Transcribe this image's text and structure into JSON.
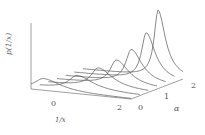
{
  "chart_data": {
    "type": "area",
    "subtype": "3d-waterfall",
    "title": "",
    "xlabel": "1/x",
    "ylabel": "p(1/x)",
    "zlabel": "α",
    "x_ticks": [
      "0",
      "2"
    ],
    "z_ticks": [
      "0",
      "1",
      "2"
    ],
    "grid": false,
    "legend": null,
    "series": [
      {
        "name": "α=0.0",
        "peak_x": -0.6,
        "peak_height": 0.15
      },
      {
        "name": "α=0.33",
        "peak_x": 0.2,
        "peak_height": 0.18
      },
      {
        "name": "α=0.67",
        "peak_x": 0.6,
        "peak_height": 0.25
      },
      {
        "name": "α=1.0",
        "peak_x": 0.9,
        "peak_height": 0.32
      },
      {
        "name": "α=1.33",
        "peak_x": 1.1,
        "peak_height": 0.42
      },
      {
        "name": "α=1.67",
        "peak_x": 1.3,
        "peak_height": 0.6
      },
      {
        "name": "α=2.0",
        "peak_x": 1.4,
        "peak_height": 0.85
      }
    ]
  },
  "labels": {
    "ylabel": "p(1/x)",
    "xlabel": "1/x",
    "zlabel": "α",
    "x_tick_0": "0",
    "x_tick_2": "2",
    "z_tick_0": "0",
    "z_tick_1": "1",
    "z_tick_2": "2"
  }
}
